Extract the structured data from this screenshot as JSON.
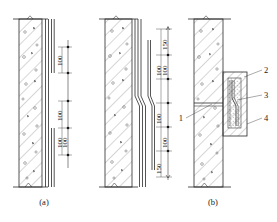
{
  "figure": {
    "type": "engineering-section-drawing",
    "colors": {
      "line": "#2a2a2a",
      "hatch": "#3a3a3a",
      "background": "#ffffff"
    },
    "panels": [
      {
        "id": "a",
        "label": "(a)",
        "description": "Straight vertical bar lap splice in wall",
        "dimensions": [
          "100",
          "100",
          "100",
          "100"
        ]
      },
      {
        "id": "b-middle",
        "label": "",
        "description": "Cranked vertical bar lap splice in wall",
        "dimensions": [
          "150",
          "100",
          "100",
          "100",
          "100",
          "150"
        ]
      },
      {
        "id": "b",
        "label": "(b)",
        "description": "Wall section with enlarged splice detail box",
        "callouts": [
          {
            "number": "1",
            "target": "horizontal-joint-line"
          },
          {
            "number": "2",
            "target": "detail-box-outer-frame"
          },
          {
            "number": "3",
            "target": "cranked-rebar"
          },
          {
            "number": "4",
            "target": "detail-box-lower-edge"
          }
        ]
      }
    ],
    "dimension_values": {
      "d100": "100",
      "d150": "150"
    },
    "callout_numbers": {
      "one": "1",
      "two": "2",
      "three": "3",
      "four": "4"
    },
    "panel_labels": {
      "a": "(a)",
      "b": "(b)"
    }
  }
}
